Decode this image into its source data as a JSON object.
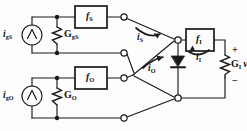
{
  "figure": {
    "type": "circuit-schematic"
  },
  "colors": {
    "line": "#1a1a1a",
    "background": "#fdfdfd",
    "text": "#111111",
    "node": "#1a1a1a",
    "terminal_fill": "#ffffff"
  },
  "sources": [
    {
      "name": "source-gs",
      "current_label": "i",
      "current_sub": "gS",
      "conductance_label": "G",
      "conductance_sub": "gS",
      "block_label": "f",
      "block_sub": "S"
    },
    {
      "name": "source-go",
      "current_label": "i",
      "current_sub": "gO",
      "conductance_label": "G",
      "conductance_sub": "O",
      "block_label": "f",
      "block_sub": "O"
    }
  ],
  "branch_currents": [
    {
      "name": "current-is",
      "label": "i",
      "sub": "S"
    },
    {
      "name": "current-io",
      "label": "i",
      "sub": "O"
    },
    {
      "name": "current-ii",
      "label": "i",
      "sub": "I"
    }
  ],
  "output_stage": {
    "block_label": "f",
    "block_sub": "I",
    "conductance_label": "G",
    "conductance_sub": "I",
    "voltage_label": "v",
    "voltage_sub": "I",
    "plus": "+",
    "minus": "−"
  },
  "components": {
    "diode_name": "diode",
    "source_symbol": "∧"
  }
}
